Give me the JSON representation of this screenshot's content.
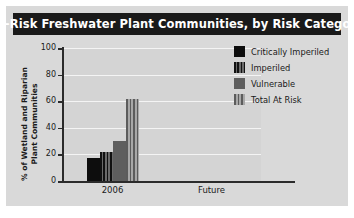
{
  "chart_data": {
    "type": "bar",
    "title": "At-Risk Freshwater Plant Communities, by Risk Category",
    "xlabel": "",
    "ylabel": "% of Wetland and Riparian Plant Communities",
    "ylim": [
      0,
      100
    ],
    "yticks": [
      0,
      20,
      40,
      60,
      80,
      100
    ],
    "ytick_labels": [
      "0",
      "20",
      "40",
      "60",
      "80",
      "100"
    ],
    "categories": [
      "2006",
      "Future"
    ],
    "grid": true,
    "legend_position": "right",
    "series": [
      {
        "name": "Critically Imperiled",
        "values": [
          17,
          null
        ],
        "swatch": "solid-black"
      },
      {
        "name": "Imperiled",
        "values": [
          22,
          null
        ],
        "swatch": "stripe-dark"
      },
      {
        "name": "Vulnerable",
        "values": [
          30,
          null
        ],
        "swatch": "solid-gray"
      },
      {
        "name": "Total At Risk",
        "values": [
          62,
          null
        ],
        "swatch": "stripe-light"
      }
    ]
  },
  "colors": {
    "title_bar_bg": "#1a1a1a",
    "title_text": "#ffffff",
    "plate_bg": "#d9d9d9",
    "plot_bg": "#d4d4d4",
    "gridline": "#f4f4f4",
    "axis": "#2b2b2b",
    "critically_imperiled": "#0d0d0d",
    "imperiled": "#3d3d3d",
    "vulnerable": "#5e5e5e",
    "total_at_risk": "#8a8a8a"
  }
}
